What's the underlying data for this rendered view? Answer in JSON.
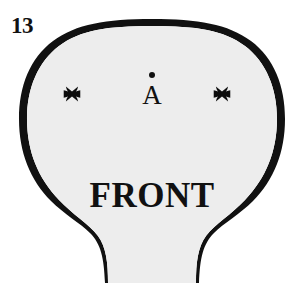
{
  "figure": {
    "number": "13",
    "type": "technical-line-drawing",
    "caption_text": "FRONT",
    "background_color": "#ffffff",
    "body_fill_color": "#ededed",
    "outline_color": "#111111",
    "outline_width_px": 3
  },
  "labels": {
    "figure_number": "13",
    "front_label": "FRONT",
    "point_a_letter": "A",
    "point_a_dot": "dot"
  },
  "markers": {
    "left": {
      "name": "x-mark-left",
      "symbol": "✖",
      "x": 72,
      "y": 94
    },
    "right": {
      "name": "x-mark-right",
      "symbol": "✖",
      "x": 222,
      "y": 94
    },
    "center_point": {
      "name": "point-a",
      "symbol": "A",
      "x": 152,
      "y": 86
    }
  },
  "shape": {
    "description": "rounded bulbous body with narrowing stem at bottom",
    "path": "M 152 20 C 196 20 224 24 248 40 C 272 56 284 84 284 118 C 284 158 268 192 240 216 C 226 228 212 236 204 248 C 197 259 195 270 195 283 L 109 283 C 109 270 107 259 100 248 C 92 236 78 228 64 216 C 36 192 20 158 20 118 C 20 84 32 56 56 40 C 80 24 108 20 152 20 Z"
  },
  "colors": {
    "ink": "#111111",
    "fill": "#ededed",
    "paper": "#ffffff"
  }
}
